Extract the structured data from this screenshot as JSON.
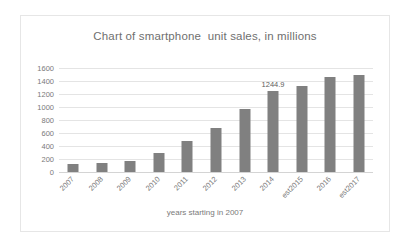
{
  "chart_data": {
    "type": "bar",
    "title": "Chart of smartphone  unit sales, in millions",
    "xlabel": "years starting in 2007",
    "ylabel": "",
    "ylim": [
      0,
      1600
    ],
    "ytick_step": 200,
    "yticks": [
      "1600",
      "1400",
      "1200",
      "1000",
      "800",
      "600",
      "400",
      "200",
      "0"
    ],
    "grid": true,
    "legend": "none",
    "bar_color": "#808080",
    "categories": [
      "2007",
      "2008",
      "2009",
      "2010",
      "2011",
      "2012",
      "2013",
      "2014",
      "est2015",
      "2016",
      "est2017"
    ],
    "values": [
      122,
      139,
      173,
      297,
      472,
      680,
      968,
      1244.9,
      1330,
      1460,
      1490
    ],
    "annotations": [
      {
        "category": "2014",
        "text": "1244.9"
      }
    ]
  }
}
